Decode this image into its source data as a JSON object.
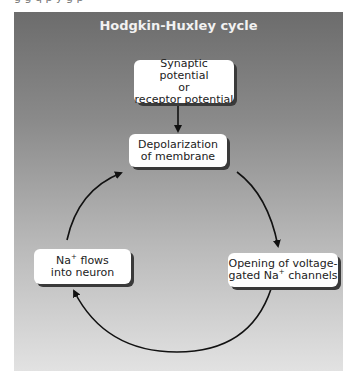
{
  "clipped_caption": "g g q p y g p",
  "diagram": {
    "title": "Hodgkin-Huxley cycle",
    "nodes": [
      {
        "id": "synaptic",
        "line1": "Synaptic potential",
        "line2": "or",
        "line3": "receptor potential"
      },
      {
        "id": "depolarization",
        "line1": "Depolarization",
        "line2": "of membrane"
      },
      {
        "id": "opening",
        "line1": "Opening of voltage-",
        "line2_pre": "gated Na",
        "line2_sup": "+",
        "line2_post": " channels"
      },
      {
        "id": "naflows",
        "line1_pre": "Na",
        "line1_sup": "+",
        "line1_post": " flows",
        "line2": "into neuron"
      }
    ],
    "edges": [
      {
        "from": "synaptic",
        "to": "depolarization"
      },
      {
        "from": "depolarization",
        "to": "opening"
      },
      {
        "from": "opening",
        "to": "naflows"
      },
      {
        "from": "naflows",
        "to": "depolarization"
      }
    ],
    "colors": {
      "panel_top": "#6c6c6c",
      "panel_bottom": "#e2e2e2",
      "title": "#f2f2f2",
      "box": "#ffffff",
      "arrow": "#111111"
    }
  }
}
